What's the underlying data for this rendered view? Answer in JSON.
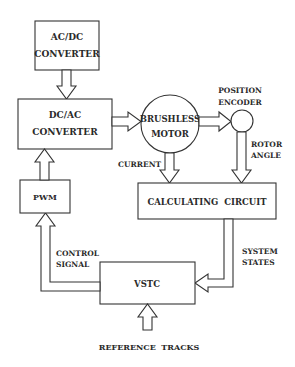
{
  "diagram": {
    "type": "block-diagram",
    "blocks": {
      "ac_dc": {
        "line1": "AC/DC",
        "line2": "CONVERTER"
      },
      "dc_ac": {
        "line1": "DC/AC",
        "line2": "CONVERTER"
      },
      "motor": {
        "line1": "BRUSHLESS",
        "line2": "MOTOR"
      },
      "encoder": {
        "line1": "POSITION",
        "line2": "ENCODER"
      },
      "calc": {
        "label": "CALCULATING  CIRCUIT"
      },
      "pwm": {
        "label": "PWM"
      },
      "vstc": {
        "label": "VSTC"
      }
    },
    "signals": {
      "current": "CURRENT",
      "rotor_angle": {
        "line1": "ROTOR",
        "line2": "ANGLE"
      },
      "system_states": {
        "line1": "SYSTEM",
        "line2": "STATES"
      },
      "control_signal": {
        "line1": "CONTROL",
        "line2": "SIGNAL"
      },
      "reference": "REFERENCE  TRACKS"
    },
    "colors": {
      "stroke": "#333333",
      "background": "#ffffff",
      "text": "#2a2a2a"
    }
  }
}
